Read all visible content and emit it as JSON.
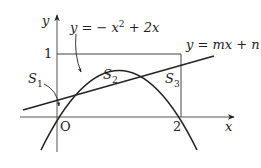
{
  "diagram": {
    "axes": {
      "x_label": "x",
      "y_label": "y",
      "origin_label": "O",
      "x_tick_label": "2",
      "y_tick_label": "1"
    },
    "curves": {
      "parabola": {
        "equation_lhs": "y = − x",
        "equation_exp": "2",
        "equation_rhs": " + 2x"
      },
      "line": {
        "equation": "y = mx + n"
      }
    },
    "regions": [
      {
        "name": "S",
        "sub": "1"
      },
      {
        "name": "S",
        "sub": "2"
      },
      {
        "name": "S",
        "sub": "3"
      }
    ],
    "colors": {
      "stroke": "#222222",
      "background": "#ffffff"
    }
  }
}
